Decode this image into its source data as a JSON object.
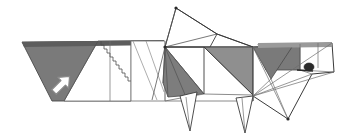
{
  "document": {
    "kind": "origami-folding-diagram",
    "title": "Origami animal step diagram",
    "subject": "folded paper animal figure, side view facing right",
    "canvas": {
      "width": 337,
      "height": 137,
      "background": "#ffffff"
    }
  },
  "palette": {
    "paper_front": "#ffffff",
    "paper_back_dark": "#7a7a7a",
    "paper_back_mid": "#8f8f8f",
    "paper_back_light": "#a8a8a8",
    "crease_line": "#6d6d6d",
    "edge_line": "#3a3a3a",
    "eye_dark": "#2b2b2b",
    "arrow_fill": "#ffffff",
    "arrow_stroke": "#8a8a8a"
  },
  "annotations": {
    "arrow": {
      "name": "fold-direction-arrow",
      "style": "hollow outline arrow",
      "direction": "up-right",
      "angle_degrees": -45,
      "position": {
        "x": 54,
        "y": 92
      },
      "label": ""
    }
  },
  "regions": [
    {
      "id": "tail",
      "name": "tail-panel",
      "shade": "paper_back_dark",
      "description": "large shaded parallelogram at left"
    },
    {
      "id": "tail-fold",
      "name": "tail-fold-panel",
      "shade": "paper_front",
      "description": "white band folded along tail"
    },
    {
      "id": "body",
      "name": "body-panel",
      "shade": "paper_front",
      "description": "central white body with radiating creases"
    },
    {
      "id": "back",
      "name": "back-shaded-panel",
      "shade": "paper_back_mid",
      "description": "shaded band along the back of the body"
    },
    {
      "id": "belly",
      "name": "belly-shaded-wedge",
      "shade": "paper_back_dark",
      "description": "dark wedge under the chest"
    },
    {
      "id": "head",
      "name": "head-panel",
      "shade": "paper_front",
      "description": "head at right with ear and snout"
    },
    {
      "id": "ear",
      "name": "ear-shaded-panel",
      "shade": "paper_back_dark",
      "description": "dark folded ear triangle"
    },
    {
      "id": "eye",
      "name": "eye-mark",
      "shade": "eye_dark",
      "description": "small dark eye near the snout"
    },
    {
      "id": "legs",
      "name": "leg-points",
      "shade": "paper_front",
      "description": "two narrow leg points at the bottom"
    }
  ],
  "geometry": {
    "outline": "22,42 160,40 176,8 217,34 258,47 332,43 334,72 312,74 288,119 270,74 253,96 245,133 236,98 218,101 197,92 190,131 180,96 152,100 103,101 52,101",
    "tail_dark": "22,42 164,41 131,101 52,101",
    "tail_white_band": "57,41 164,41 131,101 26,101",
    "tail_dark_left": "22,42 98,41 64,101 52,101",
    "tail_dark_hatch_top": "22,42 164,41 160,46 24,47",
    "body_back_shade": "165,47 253,47 253,95 204,47",
    "belly_dark_wedge": "165,47 204,94 168,97 164,84",
    "ear_dark": "258,47 300,47 300,70 262,70",
    "ear_dark_tri": "253,47 290,47 272,78",
    "segments": [
      [
        22,
        42,
        164,
        41
      ],
      [
        22,
        42,
        52,
        101
      ],
      [
        52,
        101,
        131,
        101
      ],
      [
        131,
        101,
        164,
        41
      ],
      [
        98,
        41,
        64,
        101
      ],
      [
        110,
        41,
        110,
        101
      ],
      [
        128,
        41,
        128,
        101
      ],
      [
        140,
        41,
        158,
        100
      ],
      [
        164,
        41,
        164,
        101
      ],
      [
        164,
        41,
        176,
        8
      ],
      [
        176,
        8,
        217,
        34
      ],
      [
        217,
        34,
        210,
        47
      ],
      [
        176,
        8,
        165,
        47
      ],
      [
        165,
        47,
        210,
        47
      ],
      [
        165,
        47,
        217,
        34
      ],
      [
        165,
        47,
        176,
        8
      ],
      [
        204,
        47,
        253,
        47
      ],
      [
        204,
        47,
        253,
        95
      ],
      [
        253,
        47,
        253,
        95
      ],
      [
        165,
        47,
        204,
        94
      ],
      [
        165,
        47,
        168,
        97
      ],
      [
        165,
        47,
        186,
        97
      ],
      [
        165,
        47,
        152,
        100
      ],
      [
        164,
        84,
        168,
        97
      ],
      [
        168,
        97,
        186,
        97
      ],
      [
        186,
        97,
        204,
        94
      ],
      [
        186,
        97,
        190,
        131
      ],
      [
        190,
        131,
        180,
        96
      ],
      [
        180,
        96,
        186,
        97
      ],
      [
        197,
        92,
        186,
        97
      ],
      [
        253,
        47,
        258,
        47
      ],
      [
        258,
        47,
        332,
        43
      ],
      [
        332,
        43,
        334,
        72
      ],
      [
        334,
        72,
        312,
        74
      ],
      [
        312,
        74,
        288,
        119
      ],
      [
        288,
        119,
        253,
        96
      ],
      [
        253,
        96,
        253,
        47
      ],
      [
        253,
        47,
        290,
        47
      ],
      [
        290,
        47,
        272,
        78
      ],
      [
        272,
        78,
        253,
        96
      ],
      [
        272,
        78,
        288,
        119
      ],
      [
        253,
        47,
        288,
        119
      ],
      [
        253,
        96,
        312,
        74
      ],
      [
        253,
        96,
        332,
        43
      ],
      [
        300,
        47,
        300,
        70
      ],
      [
        300,
        70,
        334,
        72
      ],
      [
        300,
        70,
        312,
        74
      ],
      [
        318,
        43,
        318,
        68
      ],
      [
        245,
        133,
        236,
        98
      ],
      [
        236,
        98,
        253,
        96
      ],
      [
        245,
        133,
        253,
        96
      ],
      [
        236,
        98,
        245,
        133
      ]
    ]
  }
}
